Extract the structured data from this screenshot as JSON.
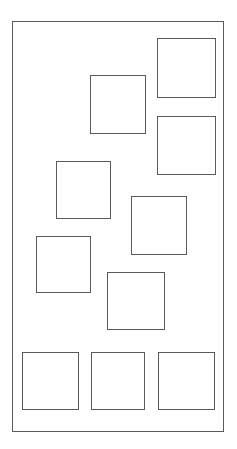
{
  "diagram": {
    "canvas": {
      "width": 237,
      "height": 449,
      "background_color": "#ffffff"
    },
    "stroke_color": "#5a5a5a",
    "stroke_width": 1,
    "fill_color": "none",
    "frame": {
      "label": "outer-frame",
      "x": 12,
      "y": 21,
      "width": 212,
      "height": 411
    },
    "shapes": [
      {
        "label": "square-top-right",
        "x": 157,
        "y": 38,
        "width": 59,
        "height": 60
      },
      {
        "label": "square-upper-middle",
        "x": 90,
        "y": 75,
        "width": 56,
        "height": 59
      },
      {
        "label": "square-right-upper-middle",
        "x": 157,
        "y": 116,
        "width": 59,
        "height": 59
      },
      {
        "label": "square-left-middle",
        "x": 56,
        "y": 161,
        "width": 55,
        "height": 58
      },
      {
        "label": "square-center-right",
        "x": 131,
        "y": 196,
        "width": 56,
        "height": 59
      },
      {
        "label": "square-lower-left",
        "x": 36,
        "y": 236,
        "width": 55,
        "height": 57
      },
      {
        "label": "square-lower-center",
        "x": 107,
        "y": 272,
        "width": 58,
        "height": 58
      },
      {
        "label": "square-bottom-left",
        "x": 22,
        "y": 352,
        "width": 57,
        "height": 58
      },
      {
        "label": "square-bottom-center",
        "x": 91,
        "y": 352,
        "width": 54,
        "height": 58
      },
      {
        "label": "square-bottom-right",
        "x": 158,
        "y": 352,
        "width": 57,
        "height": 58
      }
    ]
  }
}
